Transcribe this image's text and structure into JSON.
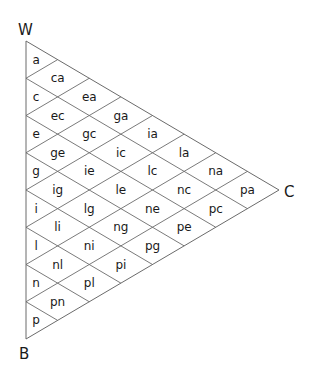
{
  "diagram": {
    "type": "ternary-triangle-grid",
    "divisions": 8,
    "vertices": {
      "top": "W",
      "right": "C",
      "bottom": "B"
    },
    "colors": {
      "line": "#6b6b6b",
      "text": "#1a1a1a",
      "background": "#ffffff"
    },
    "columns": [
      [
        "a",
        "c",
        "e",
        "g",
        "i",
        "l",
        "n",
        "p"
      ],
      [
        "ca",
        "ec",
        "ge",
        "ig",
        "li",
        "nl",
        "pn"
      ],
      [
        "ea",
        "gc",
        "ie",
        "lg",
        "ni",
        "pl"
      ],
      [
        "ga",
        "ic",
        "le",
        "ng",
        "pi"
      ],
      [
        "ia",
        "lc",
        "ne",
        "pg"
      ],
      [
        "la",
        "nc",
        "pe"
      ],
      [
        "na",
        "pc"
      ],
      [
        "pa"
      ]
    ]
  }
}
